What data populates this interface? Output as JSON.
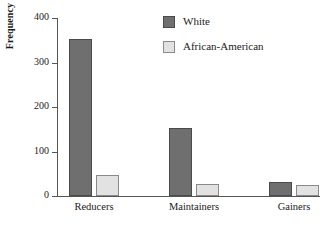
{
  "chart_data": {
    "type": "bar",
    "title": "",
    "xlabel": "",
    "ylabel": "Frequency",
    "categories": [
      "Reducers",
      "Maintainers",
      "Gainers"
    ],
    "series": [
      {
        "name": "White",
        "color": "#6f6f6f",
        "values": [
          352,
          152,
          32
        ]
      },
      {
        "name": "African-American",
        "color": "#e2e2e2",
        "values": [
          48,
          28,
          24
        ]
      }
    ],
    "ylim": [
      0,
      400
    ],
    "yticks": [
      0,
      100,
      200,
      300,
      400
    ],
    "ytick_labels": [
      "0",
      "100",
      "200",
      "300",
      "400"
    ],
    "grid": false,
    "legend_position": "top-right"
  }
}
